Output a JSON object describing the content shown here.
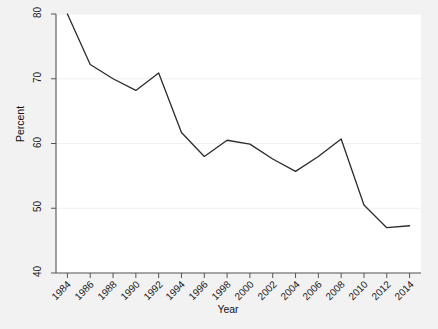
{
  "chart_data": {
    "type": "line",
    "title": "",
    "subtitle": "",
    "xlabel": "Year",
    "ylabel": "Percent",
    "x": [
      1984,
      1986,
      1988,
      1990,
      1992,
      1994,
      1996,
      1998,
      2000,
      2002,
      2004,
      2006,
      2008,
      2010,
      2012,
      2014
    ],
    "values": [
      80.0,
      72.2,
      70.0,
      68.2,
      70.9,
      61.7,
      58.0,
      60.5,
      59.9,
      57.6,
      55.7,
      58.0,
      60.7,
      50.5,
      47.0,
      47.3
    ],
    "series": [
      {
        "name": "Percent",
        "color": "#2b2b2b",
        "values": [
          80.0,
          72.2,
          70.0,
          68.2,
          70.9,
          61.7,
          58.0,
          60.5,
          59.9,
          57.6,
          55.7,
          58.0,
          60.7,
          50.5,
          47.0,
          47.3
        ]
      }
    ],
    "xlim": [
      1983.0,
      2015.0
    ],
    "ylim": [
      40,
      80
    ],
    "xticks": [
      1984,
      1986,
      1988,
      1990,
      1992,
      1994,
      1996,
      1998,
      2000,
      2002,
      2004,
      2006,
      2008,
      2010,
      2012,
      2014
    ],
    "xtick_labels": [
      "1984",
      "1986",
      "1988",
      "1990",
      "1992",
      "1994",
      "1996",
      "1998",
      "2000",
      "2002",
      "2004",
      "2006",
      "2008",
      "2010",
      "2012",
      "2014"
    ],
    "yticks": [
      40,
      50,
      60,
      70,
      80
    ],
    "ytick_labels": [
      "40",
      "50",
      "60",
      "70",
      "80"
    ],
    "grid": "horizontal",
    "legend": "none",
    "annotations": []
  },
  "style": {
    "figure_background": "#f2f2f2",
    "plot_background": "#ffffff",
    "axis_color": "#555555",
    "grid_color": "#f0f0f0",
    "line_color": "#2b2b2b",
    "text_color": "#1a1a1a"
  }
}
